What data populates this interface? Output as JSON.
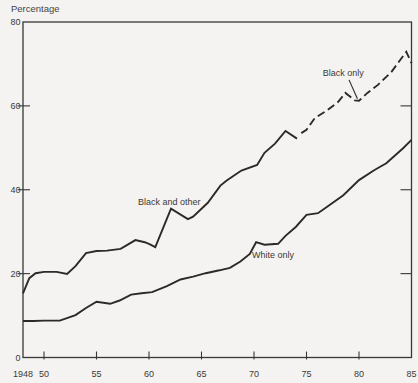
{
  "colors": {
    "background": "#f4f3f1",
    "line": "#2b2a27",
    "text": "#3c3a37"
  },
  "chart_data": {
    "type": "line",
    "title": "Percentage",
    "xlabel": "",
    "ylabel": "Percentage",
    "xlim": [
      1948,
      1985
    ],
    "ylim": [
      0,
      80
    ],
    "grid": false,
    "legend_position": "inline-annotations",
    "x_ticks": [
      {
        "x": 1948,
        "label": "1948",
        "tick": false
      },
      {
        "x": 1950,
        "label": "50",
        "tick": true
      },
      {
        "x": 1955,
        "label": "55",
        "tick": true
      },
      {
        "x": 1960,
        "label": "60",
        "tick": true
      },
      {
        "x": 1965,
        "label": "65",
        "tick": true
      },
      {
        "x": 1970,
        "label": "70",
        "tick": true
      },
      {
        "x": 1975,
        "label": "75",
        "tick": true
      },
      {
        "x": 1980,
        "label": "80",
        "tick": true
      },
      {
        "x": 1985,
        "label": "85",
        "tick": false
      }
    ],
    "y_ticks": [
      {
        "y": 0,
        "label": "0",
        "tick": false
      },
      {
        "y": 20,
        "label": "20",
        "tick": true
      },
      {
        "y": 40,
        "label": "40",
        "tick": true
      },
      {
        "y": 60,
        "label": "60",
        "tick": true
      },
      {
        "y": 80,
        "label": "80",
        "tick": false
      }
    ],
    "series": [
      {
        "name": "Black and other",
        "style": "solid",
        "points": [
          [
            1948,
            15.3
          ],
          [
            1948.6,
            18.9
          ],
          [
            1949.2,
            20.1
          ],
          [
            1950,
            20.4
          ],
          [
            1951.2,
            20.4
          ],
          [
            1952.2,
            19.9
          ],
          [
            1953,
            21.8
          ],
          [
            1954,
            24.9
          ],
          [
            1955,
            25.4
          ],
          [
            1956,
            25.5
          ],
          [
            1957.3,
            25.9
          ],
          [
            1958.7,
            28.0
          ],
          [
            1959.6,
            27.5
          ],
          [
            1960.1,
            27.0
          ],
          [
            1960.6,
            26.3
          ],
          [
            1962.1,
            35.5
          ],
          [
            1963.7,
            33.0
          ],
          [
            1964.2,
            33.6
          ],
          [
            1965.6,
            36.9
          ],
          [
            1966.8,
            41.0
          ],
          [
            1967.4,
            42.2
          ],
          [
            1968.8,
            44.6
          ],
          [
            1970.3,
            45.9
          ],
          [
            1971,
            48.8
          ],
          [
            1972,
            51.0
          ],
          [
            1973,
            54.0
          ],
          [
            1974.1,
            52.2
          ]
        ]
      },
      {
        "name": "Black only",
        "style": "dashed",
        "points": [
          [
            1974.5,
            53.5
          ],
          [
            1975,
            54.3
          ],
          [
            1975.8,
            57.1
          ],
          [
            1977,
            59.0
          ],
          [
            1978,
            60.9
          ],
          [
            1978.7,
            63.1
          ],
          [
            1979.6,
            61.3
          ],
          [
            1980,
            61.2
          ],
          [
            1980.8,
            63.1
          ],
          [
            1981.8,
            65.0
          ],
          [
            1983.1,
            68.1
          ],
          [
            1983.9,
            70.9
          ],
          [
            1984.5,
            72.9
          ],
          [
            1985,
            70.2
          ]
        ]
      },
      {
        "name": "White only",
        "style": "solid",
        "points": [
          [
            1948,
            8.7
          ],
          [
            1949,
            8.7
          ],
          [
            1950,
            8.8
          ],
          [
            1951.5,
            8.8
          ],
          [
            1953,
            10.1
          ],
          [
            1954,
            11.8
          ],
          [
            1955,
            13.3
          ],
          [
            1956.3,
            12.8
          ],
          [
            1957.2,
            13.6
          ],
          [
            1958.3,
            15.0
          ],
          [
            1959.3,
            15.3
          ],
          [
            1960.3,
            15.6
          ],
          [
            1961.7,
            17.0
          ],
          [
            1963,
            18.6
          ],
          [
            1964.2,
            19.3
          ],
          [
            1965.4,
            20.1
          ],
          [
            1966.7,
            20.8
          ],
          [
            1967.7,
            21.4
          ],
          [
            1968.7,
            22.9
          ],
          [
            1969.6,
            24.7
          ],
          [
            1970.2,
            27.5
          ],
          [
            1971,
            26.9
          ],
          [
            1972.3,
            27.1
          ],
          [
            1973,
            29.0
          ],
          [
            1974,
            31.2
          ],
          [
            1975,
            34.0
          ],
          [
            1976.1,
            34.4
          ],
          [
            1977,
            36.0
          ],
          [
            1978.5,
            38.7
          ],
          [
            1980,
            42.3
          ],
          [
            1981.4,
            44.6
          ],
          [
            1982.1,
            45.6
          ],
          [
            1982.6,
            46.3
          ],
          [
            1984.2,
            49.9
          ],
          [
            1985,
            51.9
          ]
        ]
      }
    ],
    "annotations": [
      {
        "text": "Black and other",
        "x": 1958.95,
        "y": 36.4,
        "anchor": "start"
      },
      {
        "text": "Black only",
        "x": 1976.55,
        "y": 67.1,
        "anchor": "start",
        "pointer": {
          "x1": 1979.05,
          "y1": 66.2,
          "x2": 1979.85,
          "y2": 61.7
        }
      },
      {
        "text": "White only",
        "x": 1969.8,
        "y": 23.7,
        "anchor": "start"
      }
    ]
  }
}
